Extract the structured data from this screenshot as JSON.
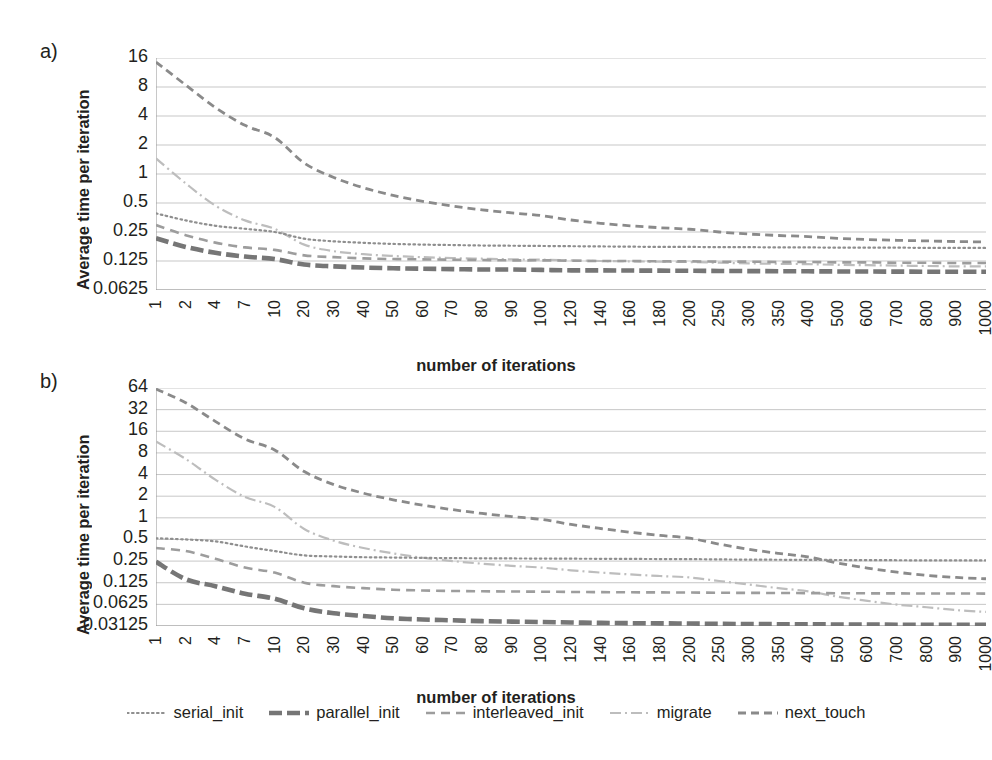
{
  "figure": {
    "panels": [
      {
        "letter": "a)",
        "ylabel": "Average time per iteration",
        "xlabel": "number of iterations"
      },
      {
        "letter": "b)",
        "ylabel": "Average time per iteration",
        "xlabel": "number of iterations"
      }
    ],
    "legend": {
      "items": [
        {
          "label": "serial_init",
          "style": "dotted",
          "color": "#7f7f7f"
        },
        {
          "label": "parallel_init",
          "style": "long-dash-thick",
          "color": "#808080"
        },
        {
          "label": "interleaved_init",
          "style": "dashed",
          "color": "#9a9a9a"
        },
        {
          "label": "migrate",
          "style": "dash-dot",
          "color": "#b4b4b4"
        },
        {
          "label": "next_touch",
          "style": "dashed-medium",
          "color": "#8c8c8c"
        }
      ]
    }
  },
  "chart_data": [
    {
      "type": "line",
      "panel": "a",
      "title": "",
      "xlabel": "number of iterations",
      "ylabel": "Average time per iteration",
      "xscale": "category",
      "yscale": "log2",
      "ylim": [
        0.0625,
        16
      ],
      "yticks": [
        16,
        8,
        4,
        2,
        1,
        0.5,
        0.25,
        0.125,
        0.0625
      ],
      "ytick_labels": [
        "16",
        "8",
        "4",
        "2",
        "1",
        "0.5",
        "0.25",
        "0.125",
        "0.0625"
      ],
      "grid": true,
      "legend_position": "bottom",
      "categories": [
        1,
        2,
        4,
        7,
        10,
        20,
        30,
        40,
        50,
        60,
        70,
        80,
        90,
        100,
        120,
        140,
        160,
        180,
        200,
        250,
        300,
        350,
        400,
        500,
        600,
        700,
        800,
        900,
        1000
      ],
      "series": [
        {
          "name": "serial_init",
          "values": [
            0.39,
            0.33,
            0.29,
            0.27,
            0.25,
            0.213,
            0.2,
            0.193,
            0.188,
            0.185,
            0.183,
            0.181,
            0.18,
            0.179,
            0.178,
            0.177,
            0.176,
            0.175,
            0.175,
            0.174,
            0.174,
            0.173,
            0.173,
            0.172,
            0.172,
            0.172,
            0.171,
            0.171,
            0.171
          ]
        },
        {
          "name": "parallel_init",
          "values": [
            0.215,
            0.175,
            0.152,
            0.139,
            0.131,
            0.115,
            0.11,
            0.107,
            0.105,
            0.104,
            0.103,
            0.102,
            0.102,
            0.101,
            0.1,
            0.1,
            0.0995,
            0.0992,
            0.099,
            0.0985,
            0.0982,
            0.0979,
            0.0977,
            0.0974,
            0.0972,
            0.097,
            0.0968,
            0.0967,
            0.0966
          ]
        },
        {
          "name": "interleaved_init",
          "values": [
            0.295,
            0.232,
            0.194,
            0.173,
            0.163,
            0.143,
            0.137,
            0.133,
            0.131,
            0.13,
            0.129,
            0.128,
            0.127,
            0.127,
            0.126,
            0.125,
            0.125,
            0.124,
            0.124,
            0.123,
            0.123,
            0.122,
            0.122,
            0.121,
            0.121,
            0.12,
            0.12,
            0.119,
            0.119
          ]
        },
        {
          "name": "migrate",
          "values": [
            1.45,
            0.8,
            0.47,
            0.33,
            0.27,
            0.185,
            0.158,
            0.147,
            0.141,
            0.137,
            0.134,
            0.132,
            0.13,
            0.129,
            0.127,
            0.125,
            0.124,
            0.123,
            0.122,
            0.12,
            0.118,
            0.117,
            0.116,
            0.114,
            0.113,
            0.112,
            0.111,
            0.11,
            0.11
          ]
        },
        {
          "name": "next_touch",
          "values": [
            14.5,
            8.4,
            4.9,
            3.2,
            2.4,
            1.3,
            0.92,
            0.72,
            0.6,
            0.52,
            0.465,
            0.425,
            0.395,
            0.37,
            0.333,
            0.308,
            0.29,
            0.277,
            0.267,
            0.25,
            0.238,
            0.23,
            0.224,
            0.215,
            0.209,
            0.205,
            0.202,
            0.199,
            0.197
          ]
        }
      ]
    },
    {
      "type": "line",
      "panel": "b",
      "title": "",
      "xlabel": "number of iterations",
      "ylabel": "Average time per iteration",
      "xscale": "category",
      "yscale": "log2",
      "ylim": [
        0.03125,
        64
      ],
      "yticks": [
        64,
        32,
        16,
        8,
        4,
        2,
        1,
        0.5,
        0.25,
        0.125,
        0.0625,
        0.03125
      ],
      "ytick_labels": [
        "64",
        "32",
        "16",
        "8",
        "4",
        "2",
        "1",
        "0.5",
        "0.25",
        "0.125",
        "0.0625",
        "0.03125"
      ],
      "grid": true,
      "legend_position": "bottom",
      "categories": [
        1,
        2,
        4,
        7,
        10,
        20,
        30,
        40,
        50,
        60,
        70,
        80,
        90,
        100,
        120,
        140,
        160,
        180,
        200,
        250,
        300,
        350,
        400,
        500,
        600,
        700,
        800,
        900,
        1000
      ],
      "series": [
        {
          "name": "serial_init",
          "values": [
            0.52,
            0.5,
            0.47,
            0.4,
            0.345,
            0.3,
            0.29,
            0.283,
            0.28,
            0.277,
            0.275,
            0.273,
            0.272,
            0.271,
            0.27,
            0.269,
            0.268,
            0.267,
            0.266,
            0.264,
            0.262,
            0.261,
            0.26,
            0.259,
            0.258,
            0.257,
            0.256,
            0.256,
            0.255
          ]
        },
        {
          "name": "parallel_init",
          "values": [
            0.245,
            0.14,
            0.112,
            0.088,
            0.075,
            0.055,
            0.047,
            0.043,
            0.04,
            0.0385,
            0.0375,
            0.0365,
            0.036,
            0.0355,
            0.035,
            0.0345,
            0.0342,
            0.034,
            0.0338,
            0.0335,
            0.0333,
            0.0331,
            0.033,
            0.0328,
            0.0327,
            0.0326,
            0.0325,
            0.0325,
            0.0324
          ]
        },
        {
          "name": "interleaved_init",
          "values": [
            0.38,
            0.345,
            0.27,
            0.203,
            0.173,
            0.125,
            0.112,
            0.105,
            0.1,
            0.0975,
            0.096,
            0.095,
            0.0943,
            0.0938,
            0.093,
            0.0925,
            0.092,
            0.0917,
            0.0913,
            0.0907,
            0.0903,
            0.09,
            0.0897,
            0.0893,
            0.089,
            0.0888,
            0.0886,
            0.0884,
            0.0883
          ]
        },
        {
          "name": "migrate",
          "values": [
            11.5,
            6.6,
            3.4,
            1.95,
            1.42,
            0.7,
            0.48,
            0.38,
            0.32,
            0.278,
            0.25,
            0.23,
            0.215,
            0.203,
            0.186,
            0.173,
            0.163,
            0.155,
            0.148,
            0.132,
            0.118,
            0.105,
            0.095,
            0.08,
            0.07,
            0.062,
            0.057,
            0.052,
            0.049
          ]
        },
        {
          "name": "next_touch",
          "values": [
            62.0,
            40.0,
            22.0,
            12.5,
            8.8,
            4.4,
            2.9,
            2.2,
            1.78,
            1.5,
            1.3,
            1.15,
            1.04,
            0.95,
            0.81,
            0.71,
            0.63,
            0.57,
            0.52,
            0.43,
            0.365,
            0.32,
            0.285,
            0.235,
            0.2,
            0.175,
            0.158,
            0.148,
            0.142
          ]
        }
      ]
    }
  ]
}
